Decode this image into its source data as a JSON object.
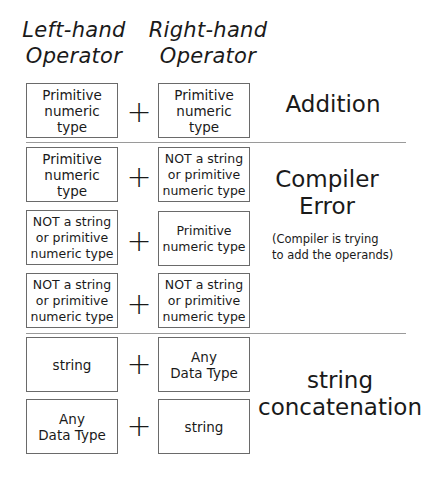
{
  "headers": {
    "left": "Left-hand\nOperator",
    "right": "Right-hand\nOperator"
  },
  "operator_symbol": "+",
  "rows": [
    {
      "left": "Primitive\nnumeric\ntype",
      "right": "Primitive\nnumeric\ntype"
    },
    {
      "left": "Primitive\nnumeric\ntype",
      "right": "NOT a string\nor primitive\nnumeric type"
    },
    {
      "left": "NOT a string\nor primitive\nnumeric type",
      "right": "Primitive\nnumeric type"
    },
    {
      "left": "NOT a string\nor primitive\nnumeric type",
      "right": "NOT a string\nor primitive\nnumeric type"
    },
    {
      "left": "string",
      "right": "Any\nData Type"
    },
    {
      "left": "Any\nData Type",
      "right": "string"
    }
  ],
  "results": {
    "addition": "Addition",
    "compiler_error": "Compiler\nError",
    "compiler_error_note": "(Compiler is trying\nto add the operands)",
    "string_concatenation": "string\nconcatenation"
  }
}
